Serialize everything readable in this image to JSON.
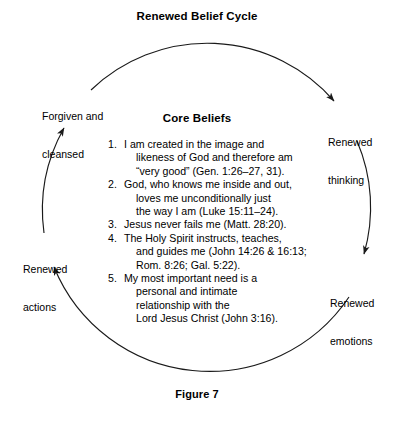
{
  "diagram": {
    "title": "Renewed Belief Cycle",
    "caption": "Figure 7",
    "center_heading": "Core Beliefs",
    "line_color": "#1a1a1a",
    "text_color": "#000000",
    "background": "#ffffff"
  },
  "cycle_nodes": [
    {
      "id": "forgiven",
      "line1": "Forgiven and",
      "line2": "cleansed",
      "position": "upper-left"
    },
    {
      "id": "thinking",
      "line1": "Renewed",
      "line2": "thinking",
      "position": "upper-right"
    },
    {
      "id": "emotions",
      "line1": "Renewed",
      "line2": "emotions",
      "position": "lower-right"
    },
    {
      "id": "actions",
      "line1": "Renewed",
      "line2": "actions",
      "position": "lower-left"
    }
  ],
  "core_beliefs": [
    {
      "number": "1.",
      "lines": [
        "I am created in the image and",
        "likeness of God and therefore am",
        "“very good” (Gen. 1:26–27, 31)."
      ]
    },
    {
      "number": "2.",
      "lines": [
        "God, who knows me inside and out,",
        "loves me unconditionally just",
        "the way I am (Luke 15:11–24)."
      ]
    },
    {
      "number": "3.",
      "lines": [
        "Jesus never fails me (Matt. 28:20)."
      ]
    },
    {
      "number": "4.",
      "lines": [
        "The Holy Spirit instructs, teaches,",
        "and guides me (John 14:26 & 16:13;",
        "Rom. 8:26; Gal. 5:22)."
      ]
    },
    {
      "number": "5.",
      "lines": [
        "My most important need is a",
        "personal and intimate",
        "relationship with the",
        "Lord Jesus Christ (John 3:16)."
      ]
    }
  ]
}
